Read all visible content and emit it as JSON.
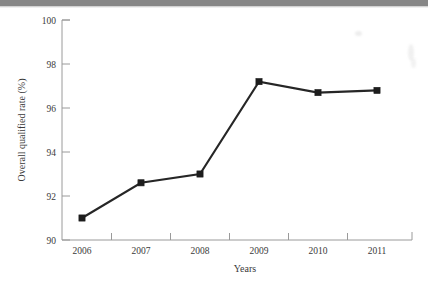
{
  "figure": {
    "background_color": "#ffffff",
    "ink_color": "#262626",
    "axis_color": "#9a9a9a"
  },
  "chart_data": {
    "type": "line",
    "title": "",
    "xlabel": "Years",
    "ylabel": "Overall qualified rate (%)",
    "categories": [
      "2006",
      "2007",
      "2008",
      "2009",
      "2010",
      "2011"
    ],
    "values": [
      91.0,
      92.6,
      93.0,
      97.2,
      96.7,
      96.8
    ],
    "series": [
      {
        "name": "Overall qualified rate",
        "values": [
          91.0,
          92.6,
          93.0,
          97.2,
          96.7,
          96.8
        ],
        "marker": "square",
        "marker_color": "#1d1d1d",
        "line_color": "#262626"
      }
    ],
    "ylim": [
      90,
      100
    ],
    "ytick_labels": [
      "90",
      "92",
      "94",
      "96",
      "98",
      "100"
    ],
    "ytick_values": [
      90,
      92,
      94,
      96,
      98,
      100
    ],
    "xtick_labels": [
      "2006",
      "2007",
      "2008",
      "2009",
      "2010",
      "2011"
    ],
    "grid": false,
    "legend": "none"
  }
}
